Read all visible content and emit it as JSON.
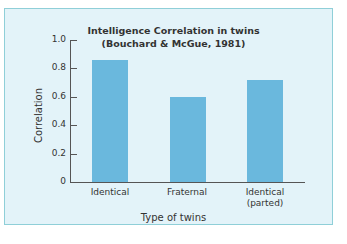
{
  "chart_data": {
    "type": "bar",
    "title": "Intelligence Correlation in twins",
    "subtitle": "(Bouchard & McGue, 1981)",
    "xlabel": "Type of twins",
    "ylabel": "Correlation",
    "categories": [
      "Identical",
      "Fraternal",
      "Identical (parted)"
    ],
    "values": [
      0.86,
      0.6,
      0.72
    ],
    "ylim": [
      0,
      1.0
    ],
    "yticks": [
      "0",
      "0.2",
      "0.4",
      "0.6",
      "0.8",
      "1.0"
    ],
    "grid": false,
    "legend": null,
    "colors": {
      "bar": "#6ab8dd",
      "background": "#e3f3f9",
      "border": "#8fcfd8"
    }
  },
  "labels": {
    "title": "Intelligence Correlation in twins",
    "subtitle": "(Bouchard & McGue, 1981)",
    "xlabel": "Type of twins",
    "ylabel": "Correlation",
    "cat1": "Identical",
    "cat2": "Fraternal",
    "cat3a": "Identical",
    "cat3b": "(parted)",
    "y0": "0",
    "y2": "0.2",
    "y4": "0.4",
    "y6": "0.6",
    "y8": "0.8",
    "y10": "1.0"
  }
}
